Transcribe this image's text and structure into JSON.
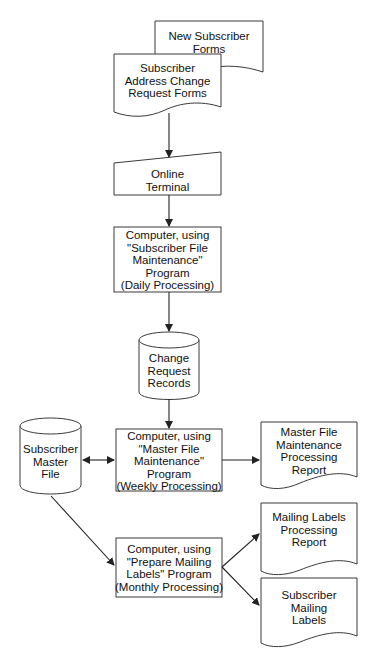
{
  "diagram": {
    "type": "system flowchart",
    "nodes": {
      "new_forms": {
        "shape": "document",
        "text": "New Subscriber\nForms"
      },
      "change_forms": {
        "shape": "document",
        "text": "Subscriber\nAddress Change\nRequest Forms"
      },
      "terminal": {
        "shape": "manual-input",
        "text": "Online\nTerminal"
      },
      "daily": {
        "shape": "process",
        "text": "Computer, using\n\"Subscriber File\nMaintenance\"\nProgram\n(Daily Processing)"
      },
      "change_records": {
        "shape": "disk-storage",
        "text": "Change\nRequest\nRecords"
      },
      "master_file": {
        "shape": "disk-storage",
        "text": "Subscriber\nMaster\nFile"
      },
      "weekly": {
        "shape": "process",
        "text": "Computer, using\n\"Master File\nMaintenance\"\nProgram\n(Weekly Processing)"
      },
      "weekly_report": {
        "shape": "document",
        "text": "Master File\nMaintenance\nProcessing\nReport"
      },
      "monthly": {
        "shape": "process",
        "text": "Computer, using\n\"Prepare Mailing\nLabels\" Program\n(Monthly Processing)"
      },
      "labels_report": {
        "shape": "document",
        "text": "Mailing Labels\nProcessing\nReport"
      },
      "labels": {
        "shape": "document",
        "text": "Subscriber\nMailing\nLabels"
      }
    },
    "edges": [
      {
        "from": "change_forms",
        "to": "terminal"
      },
      {
        "from": "terminal",
        "to": "daily"
      },
      {
        "from": "daily",
        "to": "change_records"
      },
      {
        "from": "change_records",
        "to": "weekly"
      },
      {
        "from": "master_file",
        "to": "weekly",
        "bidirectional": true
      },
      {
        "from": "weekly",
        "to": "weekly_report"
      },
      {
        "from": "master_file",
        "to": "monthly"
      },
      {
        "from": "monthly",
        "to": "labels_report"
      },
      {
        "from": "monthly",
        "to": "labels"
      }
    ],
    "colors": {
      "stroke": "#3a3a3a",
      "fill": "#ffffff",
      "text": "#111111"
    }
  }
}
